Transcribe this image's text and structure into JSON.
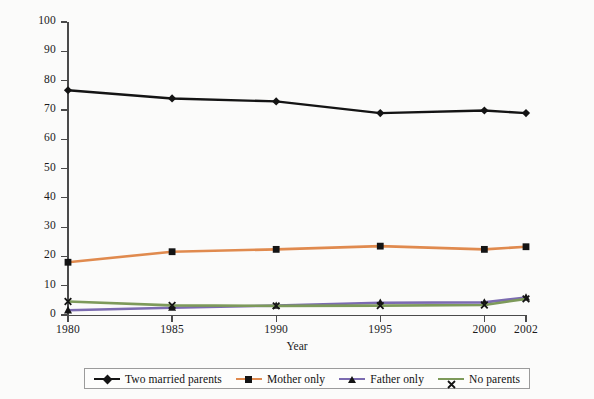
{
  "chart_data": {
    "type": "line",
    "title": "",
    "xlabel": "Year",
    "ylabel": "Percent",
    "x": [
      1980,
      1985,
      1990,
      1995,
      2000,
      2002
    ],
    "xtick_labels": [
      "1980",
      "1985",
      "1990",
      "1995",
      "2000",
      "2002"
    ],
    "ytick_labels": [
      "0",
      "10",
      "20",
      "30",
      "40",
      "50",
      "60",
      "70",
      "80",
      "90",
      "100"
    ],
    "yticks": [
      0,
      10,
      20,
      30,
      40,
      50,
      60,
      70,
      80,
      90,
      100
    ],
    "ylim": [
      0,
      100
    ],
    "xlim": [
      1980,
      2002
    ],
    "grid": false,
    "legend_position": "bottom",
    "series": [
      {
        "name": "Two married parents",
        "color": "#141414",
        "marker": "diamond",
        "values": [
          76.7,
          73.9,
          72.9,
          68.9,
          69.8,
          68.9
        ]
      },
      {
        "name": "Mother only",
        "color": "#e08a4e",
        "marker": "square",
        "values": [
          18.0,
          21.6,
          22.4,
          23.5,
          22.4,
          23.3
        ]
      },
      {
        "name": "Father only",
        "color": "#7b6bb0",
        "marker": "triangle",
        "values": [
          1.6,
          2.5,
          3.2,
          4.2,
          4.3,
          6.0
        ]
      },
      {
        "name": "No parents",
        "color": "#7d9a5a",
        "marker": "cross",
        "values": [
          4.6,
          3.3,
          3.1,
          3.2,
          3.4,
          5.5
        ]
      }
    ]
  }
}
